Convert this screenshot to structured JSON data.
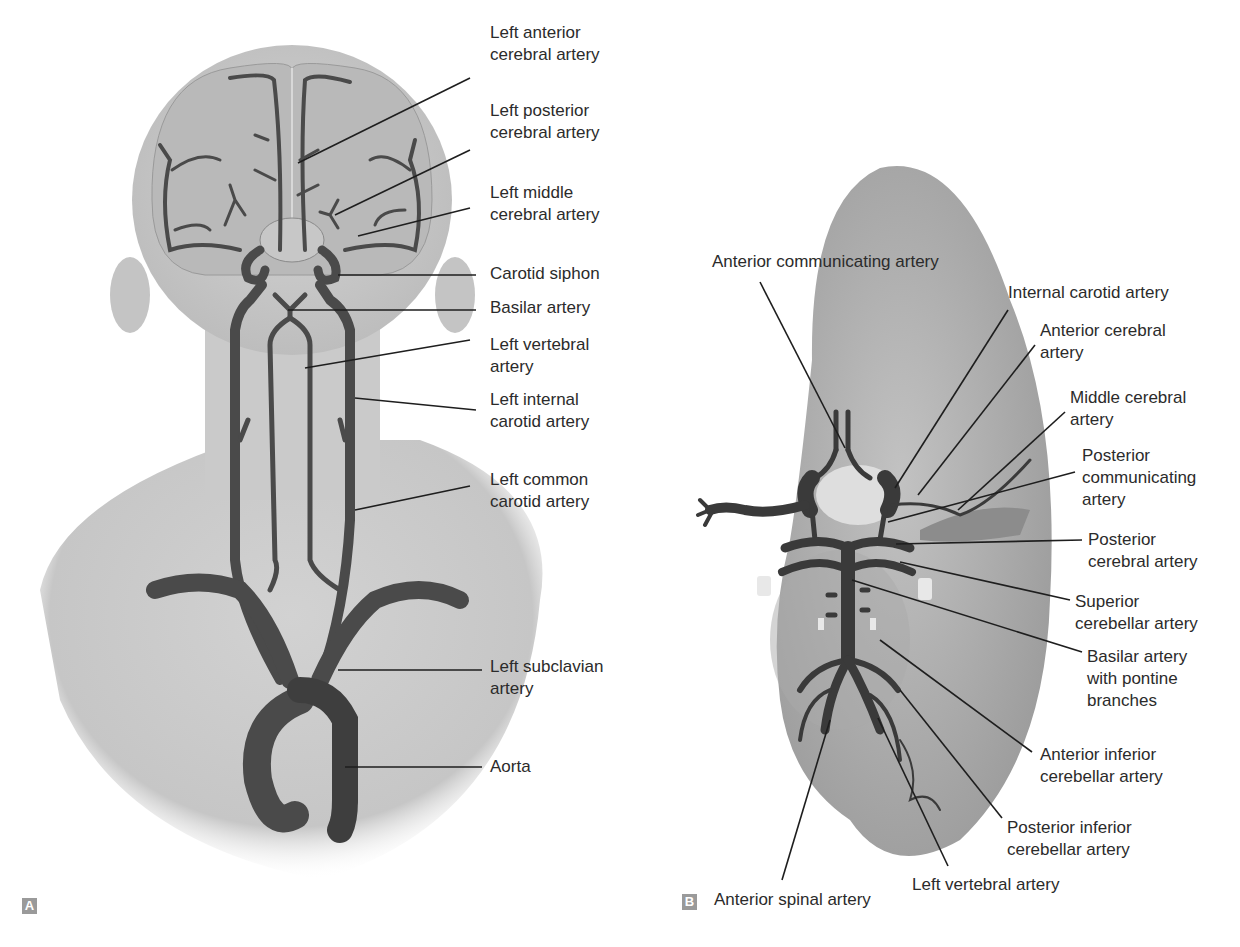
{
  "figure": {
    "panels": [
      {
        "tag": "A",
        "view": "posterior view of head and neck",
        "labels": [
          {
            "id": "left-anterior-cerebral-artery",
            "lines": [
              "Left anterior",
              "cerebral artery"
            ],
            "x": 490,
            "y": 22,
            "leader": [
              [
                298,
                163
              ],
              [
                470,
                78
              ]
            ]
          },
          {
            "id": "left-posterior-cerebral-artery",
            "lines": [
              "Left posterior",
              "cerebral artery"
            ],
            "x": 490,
            "y": 100,
            "leader": [
              [
                335,
                215
              ],
              [
                470,
                150
              ]
            ]
          },
          {
            "id": "left-middle-cerebral-artery",
            "lines": [
              "Left middle",
              "cerebral artery"
            ],
            "x": 490,
            "y": 182,
            "leader": [
              [
                358,
                236
              ],
              [
                470,
                208
              ]
            ]
          },
          {
            "id": "carotid-siphon",
            "lines": [
              "Carotid siphon"
            ],
            "x": 490,
            "y": 263,
            "leader": [
              [
                338,
                275
              ],
              [
                476,
                275
              ]
            ]
          },
          {
            "id": "basilar-artery",
            "lines": [
              "Basilar artery"
            ],
            "x": 490,
            "y": 297,
            "leader": [
              [
                288,
                310
              ],
              [
                476,
                310
              ]
            ]
          },
          {
            "id": "left-vertebral-artery",
            "lines": [
              "Left vertebral",
              "artery"
            ],
            "x": 490,
            "y": 334,
            "leader": [
              [
                305,
                368
              ],
              [
                470,
                340
              ]
            ]
          },
          {
            "id": "left-internal-carotid-artery",
            "lines": [
              "Left internal",
              "carotid artery"
            ],
            "x": 490,
            "y": 389,
            "leader": [
              [
                355,
                398
              ],
              [
                476,
                410
              ]
            ]
          },
          {
            "id": "left-common-carotid-artery",
            "lines": [
              "Left common",
              "carotid artery"
            ],
            "x": 490,
            "y": 469,
            "leader": [
              [
                355,
                510
              ],
              [
                470,
                486
              ]
            ]
          },
          {
            "id": "left-subclavian-artery",
            "lines": [
              "Left subclavian",
              "artery"
            ],
            "x": 490,
            "y": 656,
            "leader": [
              [
                338,
                670
              ],
              [
                482,
                670
              ]
            ]
          },
          {
            "id": "aorta",
            "lines": [
              "Aorta"
            ],
            "x": 490,
            "y": 756,
            "leader": [
              [
                345,
                767
              ],
              [
                482,
                767
              ]
            ]
          }
        ]
      },
      {
        "tag": "B",
        "view": "inferior view of brain (circle of Willis)",
        "labels": [
          {
            "id": "anterior-communicating-artery",
            "lines": [
              "Anterior communicating artery"
            ],
            "x": 712,
            "y": 251,
            "leader": [
              [
                760,
                282
              ],
              [
                845,
                448
              ]
            ]
          },
          {
            "id": "internal-carotid-artery",
            "lines": [
              "Internal carotid artery"
            ],
            "x": 1008,
            "y": 282,
            "leader": [
              [
                1008,
                310
              ],
              [
                895,
                488
              ]
            ]
          },
          {
            "id": "anterior-cerebral-artery",
            "lines": [
              "Anterior cerebral",
              "artery"
            ],
            "x": 1040,
            "y": 320,
            "leader": [
              [
                1035,
                345
              ],
              [
                918,
                495
              ]
            ]
          },
          {
            "id": "middle-cerebral-artery",
            "lines": [
              "Middle cerebral",
              "artery"
            ],
            "x": 1070,
            "y": 387,
            "leader": [
              [
                1065,
                412
              ],
              [
                958,
                510
              ]
            ]
          },
          {
            "id": "posterior-communicating-artery",
            "lines": [
              "Posterior",
              "communicating",
              "artery"
            ],
            "x": 1082,
            "y": 445,
            "leader": [
              [
                1075,
                472
              ],
              [
                888,
                522
              ]
            ]
          },
          {
            "id": "posterior-cerebral-artery",
            "lines": [
              "Posterior",
              "cerebral artery"
            ],
            "x": 1088,
            "y": 529,
            "leader": [
              [
                1082,
                540
              ],
              [
                896,
                544
              ]
            ]
          },
          {
            "id": "superior-cerebellar-artery",
            "lines": [
              "Superior",
              "cerebellar artery"
            ],
            "x": 1075,
            "y": 591,
            "leader": [
              [
                1070,
                600
              ],
              [
                900,
                562
              ]
            ]
          },
          {
            "id": "basilar-artery-with-pontine-branches",
            "lines": [
              "Basilar artery",
              "with pontine",
              "branches"
            ],
            "x": 1087,
            "y": 646,
            "leader": [
              [
                1082,
                652
              ],
              [
                852,
                580
              ]
            ]
          },
          {
            "id": "anterior-inferior-cerebellar-artery",
            "lines": [
              "Anterior inferior",
              "cerebellar artery"
            ],
            "x": 1040,
            "y": 744,
            "leader": [
              [
                1032,
                752
              ],
              [
                880,
                640
              ]
            ]
          },
          {
            "id": "posterior-inferior-cerebellar-artery",
            "lines": [
              "Posterior inferior",
              "cerebellar artery"
            ],
            "x": 1007,
            "y": 817,
            "leader": [
              [
                1002,
                818
              ],
              [
                900,
                690
              ]
            ]
          },
          {
            "id": "left-vertebral-artery-b",
            "lines": [
              "Left vertebral artery"
            ],
            "x": 912,
            "y": 874,
            "leader": [
              [
                948,
                866
              ],
              [
                878,
                718
              ]
            ]
          },
          {
            "id": "anterior-spinal-artery",
            "lines": [
              "Anterior spinal artery"
            ],
            "x": 714,
            "y": 889,
            "leader": [
              [
                782,
                880
              ],
              [
                830,
                720
              ]
            ]
          }
        ]
      }
    ],
    "colors": {
      "artery": "#4a4a4a",
      "artery_dark": "#333333",
      "skin": "#cfcfcf",
      "brain": "#b8b8b8",
      "leader": "#1e1e1e",
      "tag_bg": "#9a9a9a",
      "text": "#2b2b2b"
    }
  }
}
